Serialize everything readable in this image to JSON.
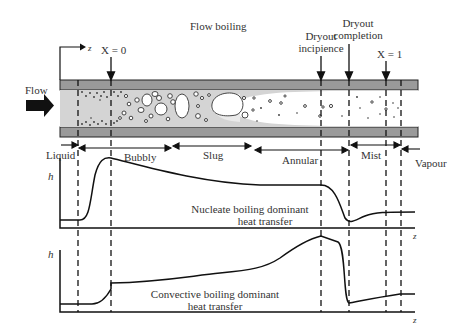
{
  "title": "Flow boiling",
  "flow_label": "Flow",
  "axis_z": "z",
  "quality_markers": {
    "x0": "X = 0",
    "x1": "X = 1"
  },
  "dryout": {
    "incipience_line1": "Dryout",
    "incipience_line2": "incipience",
    "completion_line1": "Dryout",
    "completion_line2": "completion"
  },
  "regimes": [
    {
      "label": "Liquid"
    },
    {
      "label": "Bubbly"
    },
    {
      "label": "Slug"
    },
    {
      "label": "Annular"
    },
    {
      "label": "Mist"
    },
    {
      "label": "Vapour"
    }
  ],
  "graphs": [
    {
      "y_label": "h",
      "x_label": "z",
      "caption_line1": "Nucleate boiling dominant",
      "caption_line2": "heat transfer"
    },
    {
      "y_label": "h",
      "x_label": "z",
      "caption_line1": "Convective boiling dominant",
      "caption_line2": "heat transfer"
    }
  ],
  "colors": {
    "tube_wall": "#9a9a9a",
    "tube_interior": "#d4d4d4",
    "vapour_core": "#ffffff",
    "line": "#111111"
  }
}
